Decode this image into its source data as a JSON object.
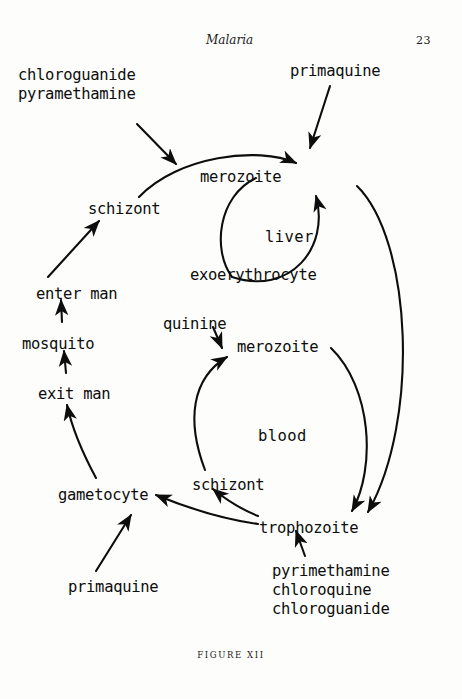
{
  "page": {
    "running_head": "Malaria",
    "page_number": "23",
    "figure_caption": "FIGURE XII"
  },
  "ink_color": "#0d0d0d",
  "paper_color": "#fdfdfb",
  "compartments": [
    {
      "id": "liver",
      "label": "liver"
    },
    {
      "id": "blood",
      "label": "blood"
    }
  ],
  "nodes": [
    {
      "id": "schizont_liver",
      "label": "schizont",
      "x": 88,
      "y": 200
    },
    {
      "id": "merozoite_liver",
      "label": "merozoite",
      "x": 200,
      "y": 168
    },
    {
      "id": "exoerythrocyte",
      "label": "exoerythrocyte",
      "x": 190,
      "y": 266
    },
    {
      "id": "enter_man",
      "label": "enter man",
      "x": 36,
      "y": 285
    },
    {
      "id": "mosquito",
      "label": "mosquito",
      "x": 22,
      "y": 335
    },
    {
      "id": "exit_man",
      "label": "exit man",
      "x": 38,
      "y": 385
    },
    {
      "id": "gametocyte",
      "label": "gametocyte",
      "x": 58,
      "y": 486
    },
    {
      "id": "merozoite_blood",
      "label": "merozoite",
      "x": 237,
      "y": 338
    },
    {
      "id": "schizont_blood",
      "label": "schizont",
      "x": 192,
      "y": 476
    },
    {
      "id": "trophozoite",
      "label": "trophozoite",
      "x": 259,
      "y": 519
    }
  ],
  "drugs": [
    {
      "id": "chloroguanide_pyramethamine",
      "lines": [
        "chloroguanide",
        "pyramethamine"
      ],
      "x": 18,
      "y": 66,
      "target": "schizont-to-merozoite transition"
    },
    {
      "id": "primaquine_top",
      "lines": [
        "primaquine"
      ],
      "x": 290,
      "y": 62,
      "target": "merozoite (liver)"
    },
    {
      "id": "quinine",
      "lines": [
        "quinine"
      ],
      "x": 163,
      "y": 315,
      "target": "schizont-to-merozoite transition (blood)"
    },
    {
      "id": "primaquine_bottom",
      "lines": [
        "primaquine"
      ],
      "x": 68,
      "y": 578,
      "target": "gametocyte"
    },
    {
      "id": "pyrimethamine_chloroquine_chloroguanide",
      "lines": [
        "pyrimethamine",
        "chloroquine",
        "chloroguanide"
      ],
      "x": 272,
      "y": 562,
      "target": "trophozoite"
    }
  ],
  "compartment_positions": {
    "liver": {
      "x": 265,
      "y": 228
    },
    "blood": {
      "x": 258,
      "y": 427
    }
  },
  "edges": [
    {
      "from": "exit_man",
      "to": "mosquito",
      "kind": "straight"
    },
    {
      "from": "mosquito",
      "to": "enter_man",
      "kind": "straight"
    },
    {
      "from": "enter_man",
      "to": "schizont_liver",
      "kind": "straight"
    },
    {
      "from": "schizont_liver",
      "to": "merozoite_liver",
      "kind": "curve"
    },
    {
      "from": "merozoite_liver",
      "to": "exoerythrocyte",
      "kind": "loop"
    },
    {
      "from": "exoerythrocyte",
      "to": "merozoite_liver",
      "kind": "loop"
    },
    {
      "from": "merozoite_liver",
      "to": "trophozoite",
      "kind": "long-curve"
    },
    {
      "from": "schizont_blood",
      "to": "merozoite_blood",
      "kind": "curve"
    },
    {
      "from": "merozoite_blood",
      "to": "trophozoite",
      "kind": "curve"
    },
    {
      "from": "trophozoite",
      "to": "schizont_blood",
      "kind": "curve"
    },
    {
      "from": "trophozoite",
      "to": "gametocyte",
      "kind": "curve"
    },
    {
      "from": "gametocyte",
      "to": "exit_man",
      "kind": "curve"
    }
  ]
}
